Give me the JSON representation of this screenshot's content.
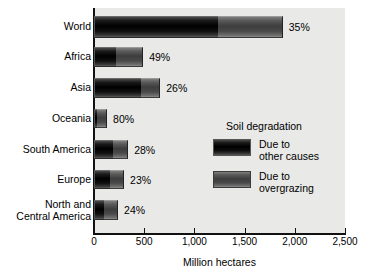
{
  "chart_data": {
    "type": "bar",
    "orientation": "horizontal",
    "stacked": true,
    "title": "",
    "xlabel": "Million hectares",
    "ylabel": "",
    "xlim": [
      0,
      2500
    ],
    "xticks": [
      0,
      500,
      1000,
      1500,
      2000,
      2500
    ],
    "xtick_labels": [
      "0",
      "500",
      "1,000",
      "1,500",
      "2,000",
      "2,500"
    ],
    "grid": false,
    "legend_position": "inside-right",
    "legend_title": "Soil degradation",
    "categories": [
      "World",
      "Africa",
      "Asia",
      "Oceania",
      "South America",
      "Europe",
      "North and\nCentral America"
    ],
    "series": [
      {
        "name": "Due to\nother causes",
        "key": "other",
        "values": [
          1235,
          220,
          470,
          25,
          190,
          160,
          100
        ]
      },
      {
        "name": "Due to\novergrazing",
        "key": "overgrazing",
        "values": [
          645,
          270,
          190,
          105,
          150,
          140,
          140
        ]
      }
    ],
    "totals": [
      1880,
      490,
      660,
      130,
      340,
      300,
      240
    ],
    "annotations": [
      "35%",
      "49%",
      "26%",
      "80%",
      "28%",
      "23%",
      "24%"
    ],
    "annotation_meaning": "share due to overgrazing"
  },
  "legend": {
    "title": "Soil degradation",
    "items": [
      {
        "label": "Due to\nother causes",
        "swatch": "dark-bar-swatch"
      },
      {
        "label": "Due to\novergrazing",
        "swatch": "mid-gray-bar-swatch"
      }
    ]
  },
  "axis": {
    "x_title": "Million hectares",
    "tick_labels": [
      "0",
      "500",
      "1,000",
      "1,500",
      "2,000",
      "2,500"
    ]
  },
  "categories": [
    {
      "label": "World",
      "pct": "35%"
    },
    {
      "label": "Africa",
      "pct": "49%"
    },
    {
      "label": "Asia",
      "pct": "26%"
    },
    {
      "label": "Oceania",
      "pct": "80%"
    },
    {
      "label": "South America",
      "pct": "28%"
    },
    {
      "label": "Europe",
      "pct": "23%"
    },
    {
      "label": "North and\nCentral America",
      "pct": "24%"
    }
  ],
  "colors": {
    "panel_background": "#e9e9e7",
    "page_background": "#ffffff",
    "axis": "#111111",
    "other_causes": "#0d0d0d",
    "overgrazing": "#4e4e4e",
    "text": "#000000"
  }
}
